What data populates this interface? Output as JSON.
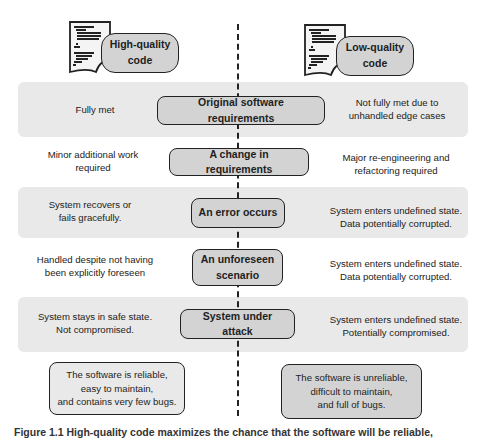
{
  "headers": {
    "left": {
      "label": "High-quality code",
      "line1": "High-quality",
      "line2": "code",
      "icon": "code-document-icon"
    },
    "right": {
      "label": "Low-quality code",
      "line1": "Low-quality",
      "line2": "code",
      "icon": "code-document-icon"
    }
  },
  "rows": [
    {
      "event": "Original software requirements",
      "event_line1": "Original software requirements",
      "event_line2": "",
      "high_line1": "Fully met",
      "high_line2": "",
      "low_line1": "Not fully met due to",
      "low_line2": "unhandled edge cases",
      "shaded": true
    },
    {
      "event": "A change in requirements",
      "event_line1": "A change in requirements",
      "event_line2": "",
      "high_line1": "Minor additional work",
      "high_line2": "required",
      "low_line1": "Major re-engineering and",
      "low_line2": "refactoring required",
      "shaded": false
    },
    {
      "event": "An error occurs",
      "event_line1": "An error occurs",
      "event_line2": "",
      "high_line1": "System recovers or",
      "high_line2": "fails gracefully.",
      "low_line1": "System enters undefined state.",
      "low_line2": "Data potentially corrupted.",
      "shaded": true
    },
    {
      "event": "An unforeseen scenario",
      "event_line1": "An unforeseen",
      "event_line2": "scenario",
      "high_line1": "Handled despite not having",
      "high_line2": "been explicitly foreseen",
      "low_line1": "System enters undefined state.",
      "low_line2": "Data potentially corrupted.",
      "shaded": false
    },
    {
      "event": "System under attack",
      "event_line1": "System under attack",
      "event_line2": "",
      "high_line1": "System stays in safe state.",
      "high_line2": "Not compromised.",
      "low_line1": "System enters undefined state.",
      "low_line2": "Potentially compromised.",
      "shaded": true
    }
  ],
  "summaries": {
    "high": {
      "line1": "The software is reliable,",
      "line2": "easy to maintain,",
      "line3": "and contains very few bugs."
    },
    "low": {
      "line1": "The software is unreliable,",
      "line2": "difficult to maintain,",
      "line3": "and full of bugs."
    }
  },
  "caption": "Figure 1.1   High-quality code maximizes the chance that the software will be reliable,",
  "colors": {
    "band": "#e9e9e9",
    "node": "#d3d3d3",
    "stroke": "#222222"
  }
}
